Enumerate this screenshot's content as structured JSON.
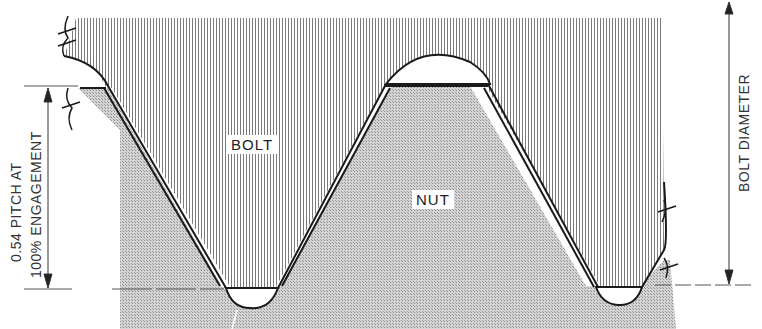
{
  "diagram": {
    "type": "thread-engagement-cross-section",
    "labels": {
      "bolt": "BOLT",
      "nut": "NUT",
      "pitch_line1": "0.54 PITCH AT",
      "pitch_line2": "100% ENGAGEMENT",
      "bolt_diameter": "BOLT DIAMETER"
    },
    "regions": [
      {
        "name": "bolt",
        "fill": "vertical-hatch"
      },
      {
        "name": "nut",
        "fill": "dotted-gray"
      }
    ],
    "colors": {
      "outline": "#1a1a1a",
      "hatch": "#8a8a8a",
      "nut_fill": "#b8b8b8",
      "background": "#ffffff"
    }
  }
}
